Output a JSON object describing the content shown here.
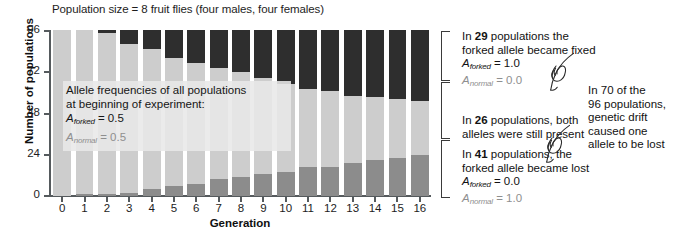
{
  "chart_data": {
    "type": "bar",
    "title": "Population size = 8 fruit flies (four males, four females)",
    "xlabel": "Generation",
    "ylabel": "Number of populations",
    "ylim": [
      0,
      96
    ],
    "yticks": [
      0,
      24,
      48,
      72,
      96
    ],
    "grid": false,
    "legend_position": "right-annotations",
    "stacked": true,
    "categories": [
      "0",
      "1",
      "2",
      "3",
      "4",
      "5",
      "6",
      "7",
      "8",
      "9",
      "10",
      "11",
      "12",
      "13",
      "14",
      "15",
      "16"
    ],
    "series": [
      {
        "name": "forked allele became lost",
        "color": "#8c8c8c",
        "values": [
          0,
          1,
          1,
          2,
          4,
          6,
          7,
          10,
          11,
          13,
          14,
          17,
          17,
          19,
          21,
          22,
          24
        ]
      },
      {
        "name": "both alleles still present",
        "color": "#cdcdcd",
        "values": [
          96,
          95,
          93,
          86,
          81,
          74,
          70,
          64,
          61,
          55,
          51,
          45,
          44,
          39,
          36,
          34,
          31
        ]
      },
      {
        "name": "forked allele became fixed",
        "color": "#2e2e2e",
        "values": [
          0,
          0,
          2,
          8,
          11,
          16,
          19,
          22,
          24,
          28,
          31,
          34,
          35,
          38,
          39,
          40,
          41
        ]
      }
    ],
    "note_in_plot": {
      "line1": "Allele frequencies of all populations",
      "line2": "at beginning of experiment:",
      "forked_label": "A",
      "forked_sub": "forked",
      "forked_value": "= 0.5",
      "normal_label": "A",
      "normal_sub": "normal",
      "normal_value": "= 0.5"
    },
    "annotations": [
      {
        "id": "fixed",
        "line1_pre": "In ",
        "line1_num": "29",
        "line1_post": " populations the",
        "line2": "forked allele became fixed",
        "allele1_label": "A",
        "allele1_sub": "forked",
        "allele1_value": "= 1.0",
        "allele2_label": "A",
        "allele2_sub": "normal",
        "allele2_value": "= 0.0"
      },
      {
        "id": "both",
        "line1_pre": "In ",
        "line1_num": "26",
        "line1_post": " populations, both",
        "line2": "alleles were still present"
      },
      {
        "id": "lost",
        "line1_pre": "In ",
        "line1_num": "41",
        "line1_post": " populations, the",
        "line2": "forked allele became lost",
        "allele1_label": "A",
        "allele1_sub": "forked",
        "allele1_value": "= 0.0",
        "allele2_label": "A",
        "allele2_sub": "normal",
        "allele2_value": "= 1.0"
      }
    ],
    "side_note": {
      "line1": "In 70 of the",
      "line2": "96 populations,",
      "line3": "genetic drift",
      "line4": "caused one",
      "line5": "allele to be lost"
    },
    "colors": {
      "fixed": "#2e2e2e",
      "both": "#cdcdcd",
      "lost": "#8c8c8c",
      "axis": "#555a5d",
      "text": "#1a1a1a",
      "dim_text": "#8f8f8f"
    }
  }
}
